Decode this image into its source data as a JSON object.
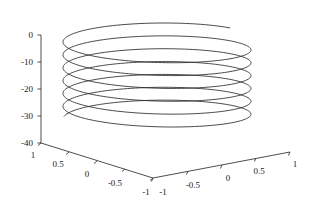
{
  "figure": {
    "name": "matlab-3d-helix-plot",
    "background_color": "#ffffff",
    "line_color": "#2b2b2b",
    "axis_color": "#3a3a3a",
    "width": 312,
    "height": 215
  },
  "chart_data": {
    "type": "line",
    "title": "",
    "xlabel": "",
    "ylabel": "",
    "zlabel": "",
    "projection": "3d",
    "grid": false,
    "legend": null,
    "parametric": {
      "x_expr": "cos(t)",
      "y_expr": "sin(t)",
      "z_expr": "-t",
      "t_start": 0,
      "t_end": 40,
      "samples": 900,
      "turns": 6.37
    },
    "xlim": [
      -1,
      1
    ],
    "ylim": [
      -1,
      1
    ],
    "zlim": [
      -40,
      0
    ],
    "x_ticks": [
      -1,
      -0.5,
      0,
      0.5,
      1
    ],
    "x_tick_labels": [
      "-1",
      "-0.5",
      "0",
      "0.5",
      "1"
    ],
    "y_ticks": [
      1,
      0.5,
      0,
      -0.5,
      -1
    ],
    "y_tick_labels": [
      "1",
      "0.5",
      "0",
      "-0.5",
      "-1"
    ],
    "z_ticks": [
      0,
      -10,
      -20,
      -30,
      -40
    ],
    "z_tick_labels": [
      "0",
      "-10",
      "-20",
      "-30",
      "-40"
    ],
    "view": {
      "azimuth": -37.5,
      "elevation": 30
    }
  },
  "axes": {
    "z_axis": {
      "name": "z-axis",
      "labels": [
        "0",
        "-10",
        "-20",
        "-30",
        "-40"
      ]
    },
    "y_axis": {
      "name": "y-axis",
      "labels": [
        "1",
        "0.5",
        "0",
        "-0.5",
        "-1"
      ]
    },
    "x_axis": {
      "name": "x-axis",
      "labels": [
        "-1",
        "-0.5",
        "0",
        "0.5",
        "1"
      ]
    }
  },
  "ticks": {
    "z": [
      {
        "label": "0",
        "tx": 33,
        "ty": 38,
        "lx": 41,
        "ly": 35
      },
      {
        "label": "-10",
        "tx": 33,
        "ty": 65,
        "lx": 41,
        "ly": 62
      },
      {
        "label": "-20",
        "tx": 33,
        "ty": 92,
        "lx": 41,
        "ly": 89
      },
      {
        "label": "-30",
        "tx": 33,
        "ty": 119,
        "lx": 41,
        "ly": 116
      },
      {
        "label": "-40",
        "tx": 33,
        "ty": 146,
        "lx": 41,
        "ly": 143
      }
    ],
    "y": [
      {
        "label": "1",
        "tx": 33,
        "ty": 158,
        "lx": 41,
        "ly": 143
      },
      {
        "label": "0.5",
        "tx": 58,
        "ty": 167,
        "lx": 69,
        "ly": 152
      },
      {
        "label": "0",
        "tx": 87,
        "ty": 177,
        "lx": 97,
        "ly": 161
      },
      {
        "label": "-0.5",
        "tx": 115,
        "ty": 186,
        "lx": 125,
        "ly": 169
      },
      {
        "label": "-1",
        "tx": 146,
        "ty": 195,
        "lx": 153,
        "ly": 178
      }
    ],
    "x": [
      {
        "label": "-1",
        "tx": 163,
        "ty": 195,
        "lx": 153,
        "ly": 178
      },
      {
        "label": "-0.5",
        "tx": 193,
        "ty": 188,
        "lx": 188,
        "ly": 171
      },
      {
        "label": "0",
        "tx": 228,
        "ty": 181,
        "lx": 222,
        "ly": 165
      },
      {
        "label": "0.5",
        "tx": 259,
        "ty": 174,
        "lx": 256,
        "ly": 158
      },
      {
        "label": "1",
        "tx": 295,
        "ty": 167,
        "lx": 290,
        "ly": 152
      }
    ]
  },
  "geometry": {
    "origin": {
      "x": 41,
      "y": 143
    },
    "z_top": {
      "x": 41,
      "y": 35
    },
    "front_corner": {
      "x": 153,
      "y": 178
    },
    "x_end": {
      "x": 290,
      "y": 152
    },
    "helix_center": {
      "x": 157,
      "y": 80
    },
    "helix_rx": 94,
    "helix_ry": 21,
    "helix_top_y": 23,
    "helix_bottom_y": 127
  }
}
